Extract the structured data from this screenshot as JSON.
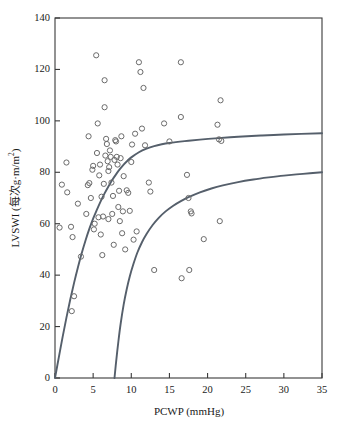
{
  "chart_data": {
    "type": "scatter",
    "title": "",
    "subtitle": "",
    "xlabel": "PCWP (mmHg)",
    "ylabel_prefix": "LVSWI (每次g·m/m",
    "ylabel_sup": "2",
    "ylabel_suffix": ")",
    "ylabel_full": "LVSWI (每次g·m/m2)",
    "xlim": [
      0,
      35
    ],
    "ylim": [
      0,
      140
    ],
    "xticks": [
      0,
      5,
      10,
      15,
      20,
      25,
      30,
      35
    ],
    "yticks": [
      0,
      20,
      40,
      60,
      80,
      100,
      120,
      140
    ],
    "xtick_labels": [
      "0",
      "5",
      "10",
      "15",
      "20",
      "25",
      "30",
      "35"
    ],
    "ytick_labels": [
      "0",
      "20",
      "40",
      "60",
      "80",
      "100",
      "120",
      "140"
    ],
    "grid": false,
    "legend": "none",
    "marker": "open-circle",
    "marker_color": "#6b6b6b",
    "marker_radius": 2.6,
    "curve_color": "#555f6b",
    "curve_width": 1.9,
    "axis_color": "#3a3a3a",
    "points": [
      [
        0.6,
        58.5
      ],
      [
        0.9,
        75.2
      ],
      [
        1.6,
        72.2
      ],
      [
        1.5,
        83.8
      ],
      [
        2.1,
        58.8
      ],
      [
        2.2,
        26.0
      ],
      [
        2.3,
        54.8
      ],
      [
        2.5,
        31.8
      ],
      [
        3.0,
        67.8
      ],
      [
        3.4,
        47.2
      ],
      [
        4.1,
        63.8
      ],
      [
        4.3,
        75.0
      ],
      [
        4.4,
        94.0
      ],
      [
        4.5,
        75.8
      ],
      [
        4.7,
        70.0
      ],
      [
        4.9,
        81.0
      ],
      [
        5.0,
        82.5
      ],
      [
        5.1,
        57.8
      ],
      [
        5.2,
        60.0
      ],
      [
        5.4,
        125.5
      ],
      [
        5.5,
        87.5
      ],
      [
        5.6,
        99.0
      ],
      [
        5.7,
        62.5
      ],
      [
        5.8,
        78.8
      ],
      [
        5.9,
        83.0
      ],
      [
        6.0,
        55.8
      ],
      [
        6.1,
        70.5
      ],
      [
        6.2,
        47.8
      ],
      [
        6.3,
        62.8
      ],
      [
        6.4,
        75.5
      ],
      [
        6.5,
        105.3
      ],
      [
        6.5,
        115.8
      ],
      [
        6.6,
        86.5
      ],
      [
        6.7,
        93.0
      ],
      [
        6.8,
        91.0
      ],
      [
        6.9,
        84.3
      ],
      [
        7.0,
        80.5
      ],
      [
        7.0,
        61.8
      ],
      [
        7.1,
        82.0
      ],
      [
        7.2,
        88.5
      ],
      [
        7.3,
        86.0
      ],
      [
        7.4,
        76.0
      ],
      [
        7.5,
        63.8
      ],
      [
        7.6,
        70.8
      ],
      [
        7.7,
        51.8
      ],
      [
        7.8,
        84.8
      ],
      [
        7.9,
        92.5
      ],
      [
        8.0,
        92.0
      ],
      [
        8.1,
        86.0
      ],
      [
        8.2,
        83.0
      ],
      [
        8.3,
        66.5
      ],
      [
        8.4,
        72.8
      ],
      [
        8.5,
        61.0
      ],
      [
        8.6,
        85.5
      ],
      [
        8.7,
        94.0
      ],
      [
        8.8,
        56.3
      ],
      [
        8.9,
        64.8
      ],
      [
        9.0,
        78.5
      ],
      [
        9.2,
        50.0
      ],
      [
        9.4,
        73.0
      ],
      [
        9.6,
        72.0
      ],
      [
        9.8,
        65.0
      ],
      [
        10.0,
        84.0
      ],
      [
        10.1,
        90.8
      ],
      [
        10.3,
        53.8
      ],
      [
        10.5,
        95.0
      ],
      [
        10.7,
        57.0
      ],
      [
        11.0,
        122.8
      ],
      [
        11.2,
        119.0
      ],
      [
        11.4,
        97.0
      ],
      [
        11.6,
        112.8
      ],
      [
        11.8,
        90.5
      ],
      [
        12.3,
        76.0
      ],
      [
        12.5,
        72.5
      ],
      [
        13.0,
        42.0
      ],
      [
        14.3,
        99.0
      ],
      [
        15.0,
        92.0
      ],
      [
        16.5,
        122.8
      ],
      [
        16.5,
        101.5
      ],
      [
        16.6,
        38.8
      ],
      [
        17.3,
        79.0
      ],
      [
        17.5,
        70.0
      ],
      [
        17.6,
        42.0
      ],
      [
        17.8,
        64.8
      ],
      [
        17.9,
        64.0
      ],
      [
        19.5,
        54.0
      ],
      [
        21.3,
        98.5
      ],
      [
        21.5,
        92.8
      ],
      [
        21.6,
        61.0
      ],
      [
        21.7,
        108.0
      ],
      [
        21.8,
        92.2
      ]
    ],
    "curves": [
      {
        "name": "upper-boundary-curve",
        "description": "Upper envelope: rises steeply from origin then plateaus near 95",
        "points": [
          [
            0.0,
            0.0
          ],
          [
            0.5,
            8.0
          ],
          [
            1.0,
            16.0
          ],
          [
            1.5,
            23.5
          ],
          [
            2.0,
            30.5
          ],
          [
            2.5,
            37.0
          ],
          [
            3.0,
            43.0
          ],
          [
            3.5,
            48.5
          ],
          [
            4.0,
            53.5
          ],
          [
            4.5,
            58.0
          ],
          [
            5.0,
            62.0
          ],
          [
            5.5,
            65.5
          ],
          [
            6.0,
            68.8
          ],
          [
            6.5,
            71.8
          ],
          [
            7.0,
            74.5
          ],
          [
            7.5,
            77.0
          ],
          [
            8.0,
            79.2
          ],
          [
            8.5,
            81.2
          ],
          [
            9.0,
            83.0
          ],
          [
            9.5,
            84.5
          ],
          [
            10.0,
            85.8
          ],
          [
            11.0,
            87.8
          ],
          [
            12.0,
            89.2
          ],
          [
            13.0,
            90.2
          ],
          [
            14.0,
            90.9
          ],
          [
            15.0,
            91.4
          ],
          [
            17.0,
            92.1
          ],
          [
            19.0,
            92.7
          ],
          [
            21.0,
            93.2
          ],
          [
            24.0,
            93.8
          ],
          [
            27.0,
            94.3
          ],
          [
            30.0,
            94.7
          ],
          [
            35.0,
            95.2
          ]
        ]
      },
      {
        "name": "lower-boundary-curve",
        "description": "Lower envelope: starts at x≈7.8 at y=0, rises to about 80 at x=35",
        "points": [
          [
            7.8,
            0.0
          ],
          [
            8.0,
            6.0
          ],
          [
            8.3,
            14.0
          ],
          [
            8.6,
            21.0
          ],
          [
            9.0,
            28.5
          ],
          [
            9.4,
            34.5
          ],
          [
            9.8,
            39.5
          ],
          [
            10.3,
            44.5
          ],
          [
            10.8,
            48.8
          ],
          [
            11.4,
            52.8
          ],
          [
            12.0,
            56.0
          ],
          [
            12.8,
            59.5
          ],
          [
            13.6,
            62.3
          ],
          [
            14.5,
            64.8
          ],
          [
            15.5,
            67.0
          ],
          [
            16.5,
            68.8
          ],
          [
            17.5,
            70.3
          ],
          [
            19.0,
            72.2
          ],
          [
            20.5,
            73.7
          ],
          [
            22.0,
            74.9
          ],
          [
            24.0,
            76.2
          ],
          [
            26.0,
            77.2
          ],
          [
            28.0,
            78.0
          ],
          [
            30.0,
            78.7
          ],
          [
            32.5,
            79.4
          ],
          [
            35.0,
            80.0
          ]
        ]
      }
    ]
  },
  "plot_geometry": {
    "left": 55,
    "right": 322,
    "top": 18,
    "bottom": 378
  }
}
